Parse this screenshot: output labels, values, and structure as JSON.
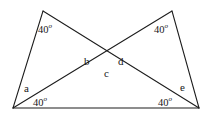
{
  "figure": {
    "type": "geometry-diagram",
    "background_color": "#ffffff",
    "line_color": "#1c1c1c",
    "text_color": "#181818",
    "degree_symbol": "o"
  },
  "vertices": {
    "bottom_left": {
      "name": "bottom-left-vertex",
      "x": 13,
      "y": 108
    },
    "bottom_right": {
      "name": "bottom-right-vertex",
      "x": 199,
      "y": 108
    },
    "top_left_apex": {
      "name": "top-left-apex",
      "x": 43,
      "y": 11
    },
    "top_right_apex": {
      "name": "top-right-apex",
      "x": 172,
      "y": 11
    },
    "crossing": {
      "name": "crossing-point",
      "x": 108,
      "y": 64
    }
  },
  "segments": [
    {
      "name": "base-line",
      "from": "bottom_left",
      "to": "bottom_right"
    },
    {
      "name": "left-apex-to-bottom-left",
      "from": "top_left_apex",
      "to": "bottom_left"
    },
    {
      "name": "left-apex-to-bottom-right",
      "from": "top_left_apex",
      "to": "bottom_right"
    },
    {
      "name": "right-apex-to-bottom-right",
      "from": "top_right_apex",
      "to": "bottom_right"
    },
    {
      "name": "right-apex-to-bottom-left",
      "from": "top_right_apex",
      "to": "bottom_left"
    }
  ],
  "labels": {
    "angle_top_left": {
      "value": "40",
      "unit": "o",
      "x": 38,
      "y": 23
    },
    "angle_top_right": {
      "value": "40",
      "unit": "o",
      "x": 154,
      "y": 23
    },
    "angle_bottom_left": {
      "value": "40",
      "unit": "o",
      "x": 33,
      "y": 96
    },
    "angle_bottom_right": {
      "value": "40",
      "unit": "o",
      "x": 158,
      "y": 96
    },
    "letter_a": {
      "text": "a",
      "x": 24,
      "y": 83
    },
    "letter_b": {
      "text": "b",
      "x": 84,
      "y": 56
    },
    "letter_c": {
      "text": "c",
      "x": 104,
      "y": 68
    },
    "letter_d": {
      "text": "d",
      "x": 118,
      "y": 56
    },
    "letter_e": {
      "text": "e",
      "x": 180,
      "y": 82
    }
  }
}
